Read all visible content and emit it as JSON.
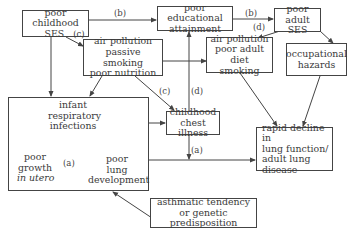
{
  "diagram": {
    "nodes": {
      "poor_childhood_ses": {
        "line1": "poor childhood",
        "line2": "SES",
        "label": "(c)"
      },
      "poor_educational_attainment": {
        "line1": "poor educational",
        "line2": "attainment"
      },
      "poor_adult_ses": {
        "line1": "poor adult",
        "line2": "SES"
      },
      "childhood_exposures": {
        "line1": "air pollution",
        "line2": "passive smoking",
        "line3": "poor nutrition"
      },
      "adult_exposures": {
        "line1": "air pollution",
        "line2": "poor adult diet",
        "line3": "smoking"
      },
      "occupational_hazards": {
        "line1": "occupational",
        "line2": "hazards"
      },
      "early_life_group": {
        "infant_respiratory_infections": {
          "line1": "infant",
          "line2": "respiratory",
          "line3": "infections"
        },
        "poor_growth": {
          "line1": "poor",
          "line2": "growth",
          "line3": "in utero"
        },
        "poor_lung_development": {
          "line1": "poor",
          "line2": "lung",
          "line3": "development"
        }
      },
      "childhood_chest_illness": {
        "line1": "childhood",
        "line2": "chest illness"
      },
      "rapid_decline": {
        "line1": "rapid decline in",
        "line2": "lung function/",
        "line3": "adult lung disease"
      },
      "asthmatic_tendency": {
        "line1": "asthmatic tendency",
        "line2": "or genetic predisposition"
      }
    },
    "edge_labels": {
      "b_top_left": "(b)",
      "b_top_right": "(b)",
      "d_adult": "(d)",
      "c_chest": "(c)",
      "d_chest": "(d)",
      "a_growth": "(a)",
      "a_chest": "(a)"
    },
    "colors": {
      "line": "#444444",
      "text": "#3a3a3a",
      "background": "#ffffff"
    }
  }
}
